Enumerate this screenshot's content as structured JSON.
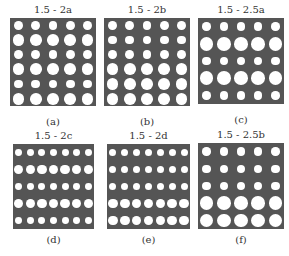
{
  "figure": {
    "plate_color": "#555555",
    "hole_color": "#ffffff",
    "background": "#ffffff",
    "panels": [
      {
        "id": "a",
        "title": "1.5 - 2a",
        "caption": "(a)",
        "box": {
          "x": 10,
          "y": 18,
          "w": 86,
          "h": 88
        },
        "cols": 5,
        "rows": [
          "small",
          "large",
          "small",
          "large",
          "small",
          "large"
        ],
        "small_d": 1.5,
        "large_d": 2
      },
      {
        "id": "b",
        "title": "1.5 - 2b",
        "caption": "(b)",
        "box": {
          "x": 104,
          "y": 18,
          "w": 86,
          "h": 88
        },
        "cols": 5,
        "rows": [
          "small",
          "small",
          "small",
          "large",
          "large",
          "large"
        ],
        "small_d": 1.5,
        "large_d": 2
      },
      {
        "id": "c",
        "title": "1.5 - 2.5a",
        "caption": "(c)",
        "box": {
          "x": 198,
          "y": 18,
          "w": 86,
          "h": 86
        },
        "cols": 5,
        "rows": [
          "small",
          "large",
          "small",
          "large",
          "small"
        ],
        "small_d": 1.5,
        "large_d": 2.5
      },
      {
        "id": "d",
        "title": "1.5 - 2c",
        "caption": "(d)",
        "box": {
          "x": 13,
          "y": 144,
          "w": 81,
          "h": 85
        },
        "cols": 7,
        "rows": [
          "small",
          "large",
          "small",
          "large",
          "small"
        ],
        "small_d": 1.5,
        "large_d": 2
      },
      {
        "id": "e",
        "title": "1.5 - 2d",
        "caption": "(e)",
        "box": {
          "x": 107,
          "y": 144,
          "w": 83,
          "h": 85
        },
        "cols": 7,
        "rows": [
          "small",
          "small",
          "small",
          "large",
          "large"
        ],
        "small_d": 1.5,
        "large_d": 2
      },
      {
        "id": "f",
        "title": "1.5 - 2.5b",
        "caption": "(f)",
        "box": {
          "x": 198,
          "y": 143,
          "w": 86,
          "h": 86
        },
        "cols": 5,
        "rows": [
          "small",
          "small",
          "small",
          "large",
          "large"
        ],
        "small_d": 1.5,
        "large_d": 2.5
      }
    ]
  }
}
